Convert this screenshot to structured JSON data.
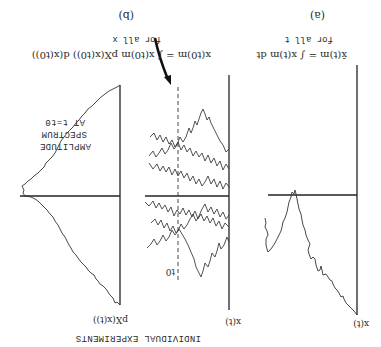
{
  "figure": {
    "orientation": "rotated 180 degrees",
    "panel_a": {
      "caption": "(a)",
      "equation": "x̄(t)m = ∫ x(t)m dt",
      "equation_note": "for all t",
      "y_axis_label": "x(t)"
    },
    "panel_b": {
      "caption": "(b)",
      "equation": "x(t0)m = ∫ x(t0)m pX(x(t0)) d(x(t0))",
      "equation_note": "for all x",
      "ensemble_axis_label": "x(t)",
      "time_marker": "t0",
      "density_axis_label": "pX(x(t))",
      "spectrum_label": [
        "AMPLITUDE",
        "SPECTRUM",
        "AT t=t0"
      ],
      "annotation": "INDIVIDUAL EXPERIMENTS"
    }
  }
}
